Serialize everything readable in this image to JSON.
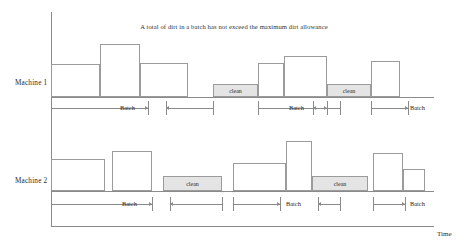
{
  "chart_data": {
    "type": "bar",
    "title": "A total of dirt in a batch has not exceed the maximum dirt allowance",
    "xlabel": "Time",
    "ylabel": "",
    "grid": false,
    "legend": null,
    "annotations": [
      "Batch",
      "clean"
    ],
    "rows": [
      {
        "label": "Machine 1",
        "bars": [
          {
            "kind": "job",
            "x0": 51,
            "x1": 100,
            "height": 33,
            "label": ""
          },
          {
            "kind": "job",
            "x0": 100,
            "x1": 140,
            "height": 53,
            "label": ""
          },
          {
            "kind": "job",
            "x0": 140,
            "x1": 188,
            "height": 34,
            "label": ""
          },
          {
            "kind": "clean",
            "x0": 213,
            "x1": 258,
            "height": 13,
            "label": "clean"
          },
          {
            "kind": "job",
            "x0": 258,
            "x1": 284,
            "height": 34,
            "label": ""
          },
          {
            "kind": "job",
            "x0": 284,
            "x1": 327,
            "height": 41,
            "label": ""
          },
          {
            "kind": "clean",
            "x0": 327,
            "x1": 371,
            "height": 13,
            "label": "clean"
          },
          {
            "kind": "job",
            "x0": 371,
            "x1": 400,
            "height": 36,
            "label": ""
          }
        ],
        "batch_spans": [
          {
            "x0": 51,
            "x1": 148,
            "label": "Batch",
            "label_x": 120,
            "arrows": "right"
          },
          {
            "x0": 166,
            "x1": 213,
            "label": "",
            "label_x": 0,
            "arrows": "left"
          },
          {
            "x0": 258,
            "x1": 327,
            "label": "Batch",
            "label_x": 289,
            "arrows": "right"
          },
          {
            "x0": 313,
            "x1": 340,
            "label": "",
            "label_x": 0,
            "arrows": "left"
          },
          {
            "x0": 371,
            "x1": 408,
            "label": "Batch",
            "label_x": 410,
            "arrows": "right"
          }
        ]
      },
      {
        "label": "Machine 2",
        "bars": [
          {
            "kind": "job",
            "x0": 51,
            "x1": 105,
            "height": 32,
            "label": ""
          },
          {
            "kind": "job",
            "x0": 112,
            "x1": 152,
            "height": 40,
            "label": ""
          },
          {
            "kind": "clean",
            "x0": 163,
            "x1": 222,
            "height": 15,
            "label": "clean"
          },
          {
            "kind": "job",
            "x0": 233,
            "x1": 286,
            "height": 28,
            "label": ""
          },
          {
            "kind": "job",
            "x0": 286,
            "x1": 312,
            "height": 50,
            "label": ""
          },
          {
            "kind": "clean",
            "x0": 312,
            "x1": 368,
            "height": 15,
            "label": "clean"
          },
          {
            "kind": "job",
            "x0": 373,
            "x1": 403,
            "height": 38,
            "label": ""
          },
          {
            "kind": "job",
            "x0": 403,
            "x1": 425,
            "height": 22,
            "label": ""
          }
        ],
        "batch_spans": [
          {
            "x0": 51,
            "x1": 152,
            "label": "Batch",
            "label_x": 122,
            "arrows": "right"
          },
          {
            "x0": 170,
            "x1": 222,
            "label": "",
            "label_x": 0,
            "arrows": "left"
          },
          {
            "x0": 233,
            "x1": 280,
            "label": "Batch",
            "label_x": 286,
            "arrows": "right"
          },
          {
            "x0": 318,
            "x1": 340,
            "label": "",
            "label_x": 0,
            "arrows": "left"
          },
          {
            "x0": 373,
            "x1": 405,
            "label": "Batch",
            "label_x": 410,
            "arrows": "right"
          }
        ]
      }
    ]
  },
  "colors": {
    "axis": "#8a8a8a",
    "bar_stroke": "#9b9b9b",
    "clean_fill": "#e4e4e4",
    "text": "#2b2b2b",
    "background": "#ffffff"
  }
}
